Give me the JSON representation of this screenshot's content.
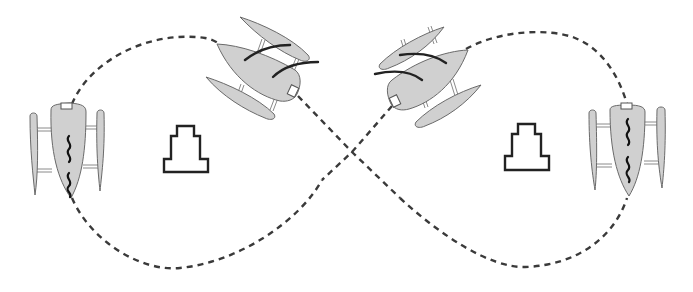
{
  "diagram": {
    "type": "figure-eight trajectory",
    "colors": {
      "background": "#ffffff",
      "hull_fill": "#d0d0d0",
      "outline": "#6a6a6a",
      "path": "#3a3a3a",
      "obstacle_stroke": "#222222",
      "sensor_fill": "#ffffff"
    },
    "path": {
      "style": "dashed",
      "shape": "figure-eight",
      "crossing_point": [
        352,
        152
      ]
    },
    "vehicles": [
      {
        "id": "boat-left",
        "position": [
          68,
          150
        ],
        "heading_deg": 180,
        "marking": "squiggle"
      },
      {
        "id": "boat-top-left",
        "position": [
          255,
          68
        ],
        "heading_deg": -60,
        "marking": "sail-lines"
      },
      {
        "id": "boat-top-right",
        "position": [
          430,
          75
        ],
        "heading_deg": 60,
        "marking": "sail-lines"
      },
      {
        "id": "boat-right",
        "position": [
          627,
          150
        ],
        "heading_deg": 180,
        "marking": "squiggle"
      }
    ],
    "obstacles": [
      {
        "id": "obstacle-left",
        "position": [
          186,
          149
        ],
        "shape": "stepped-tower"
      },
      {
        "id": "obstacle-right",
        "position": [
          526,
          146
        ],
        "shape": "stepped-tower"
      }
    ]
  }
}
